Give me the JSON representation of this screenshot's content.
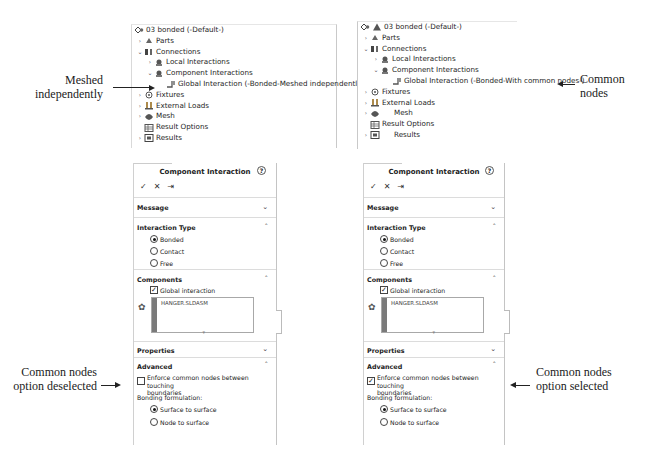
{
  "tree_left": {
    "root": "03 bonded (-Default-)",
    "items": [
      {
        "label": "Parts",
        "level": 0,
        "expander": "›",
        "icon": "parts-icon"
      },
      {
        "label": "Connections",
        "level": 0,
        "expander": "⌄",
        "icon": "connections-icon"
      },
      {
        "label": "Local Interactions",
        "level": 1,
        "expander": "›",
        "icon": "local-interactions-icon"
      },
      {
        "label": "Component Interactions",
        "level": 1,
        "expander": "⌄",
        "icon": "component-interactions-icon"
      },
      {
        "label": "Global Interaction (-Bonded-Meshed independently-)",
        "level": 2,
        "expander": "",
        "icon": "global-interaction-icon"
      },
      {
        "label": "Fixtures",
        "level": 0,
        "expander": "›",
        "icon": "fixtures-icon"
      },
      {
        "label": "External Loads",
        "level": 0,
        "expander": "›",
        "icon": "external-loads-icon"
      },
      {
        "label": "Mesh",
        "level": 0,
        "expander": "›",
        "icon": "mesh-icon"
      },
      {
        "label": "Result Options",
        "level": 0,
        "expander": "",
        "icon": "result-options-icon"
      },
      {
        "label": "Results",
        "level": 0,
        "expander": "›",
        "icon": "results-icon"
      }
    ]
  },
  "tree_right": {
    "root": "03 bonded (-Default-)",
    "items": [
      {
        "label": "Parts",
        "level": 0,
        "expander": "›",
        "icon": "parts-icon"
      },
      {
        "label": "Connections",
        "level": 0,
        "expander": "⌄",
        "icon": "connections-icon"
      },
      {
        "label": "Local Interactions",
        "level": 1,
        "expander": "›",
        "icon": "local-interactions-icon"
      },
      {
        "label": "Component Interactions",
        "level": 1,
        "expander": "⌄",
        "icon": "component-interactions-icon"
      },
      {
        "label": "Global Interaction (-Bonded-With common nodes-)",
        "level": 2,
        "expander": "",
        "icon": "global-interaction-icon"
      },
      {
        "label": "Fixtures",
        "level": 0,
        "expander": "›",
        "icon": "fixtures-icon"
      },
      {
        "label": "External Loads",
        "level": 0,
        "expander": "›",
        "icon": "external-loads-icon"
      },
      {
        "label": "Mesh",
        "level": 0,
        "expander": "›",
        "icon": "mesh-icon"
      },
      {
        "label": "Result Options",
        "level": 0,
        "expander": "",
        "icon": "result-options-icon"
      },
      {
        "label": "Results",
        "level": 0,
        "expander": "›",
        "icon": "results-icon"
      }
    ]
  },
  "annotations": {
    "meshed_independently": [
      "Meshed",
      "independently"
    ],
    "common_nodes": [
      "Common",
      "nodes"
    ],
    "deselected": [
      "Common nodes",
      "option deselected"
    ],
    "selected": [
      "Common nodes",
      "option selected"
    ]
  },
  "panel": {
    "title": "Component Interaction",
    "help": "?",
    "actions": {
      "ok": "✓",
      "cancel": "✕",
      "pin": "⇥"
    },
    "sections": {
      "message": "Message",
      "interaction_type": "Interaction Type",
      "components": "Components",
      "properties": "Properties",
      "advanced": "Advanced"
    },
    "interaction_options": [
      "Bonded",
      "Contact",
      "Free"
    ],
    "selected_interaction": "Bonded",
    "global_interaction_label": "Global interaction",
    "component_list": [
      "HANGER.SLDASM"
    ],
    "enforce_label_1": "Enforce common nodes between touching",
    "enforce_label_2": "boundaries",
    "bonding_formulation_label": "Bonding formulation:",
    "formulation_options": [
      "Surface to surface",
      "Node to surface"
    ],
    "selected_formulation": "Surface to surface"
  },
  "panel_left": {
    "enforce_checked": false
  },
  "panel_right": {
    "enforce_checked": true
  }
}
